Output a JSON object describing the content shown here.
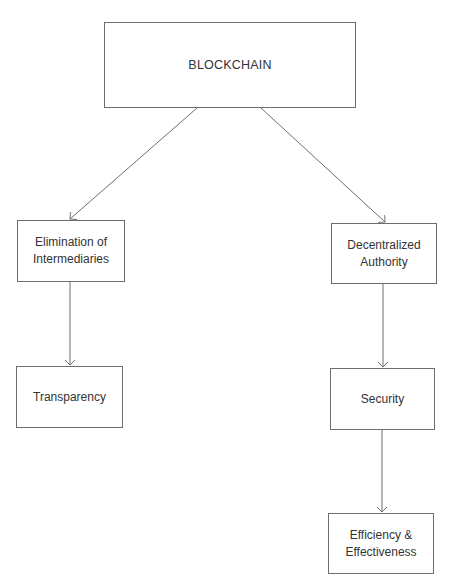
{
  "diagram": {
    "root": {
      "label": "BLOCKCHAIN"
    },
    "left_branch": [
      {
        "label": "Elimination of Intermediaries"
      },
      {
        "label": "Transparency"
      }
    ],
    "right_branch": [
      {
        "label": "Decentralized Authority"
      },
      {
        "label": "Security"
      },
      {
        "label": "Efficiency & Effectiveness"
      }
    ],
    "colors": {
      "border": "#6e6e6e",
      "line": "#6e6e6e",
      "text": "#333333",
      "background": "#ffffff"
    }
  }
}
